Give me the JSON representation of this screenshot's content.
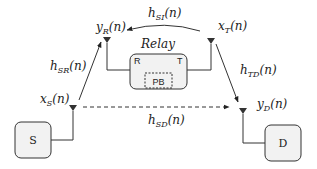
{
  "diagram": {
    "type": "full-duplex relay system model",
    "nodes": {
      "source": {
        "label": "S"
      },
      "destination": {
        "label": "D"
      },
      "relay": {
        "title": "Relay",
        "receive_port": "R",
        "transmit_port": "T",
        "buffer": "PB"
      }
    },
    "signals": {
      "x_S": {
        "base": "x",
        "sub": "S",
        "arg": "(n)"
      },
      "y_R": {
        "base": "y",
        "sub": "R",
        "arg": "(n)"
      },
      "x_T": {
        "base": "x",
        "sub": "T",
        "arg": "(n)"
      },
      "y_D": {
        "base": "y",
        "sub": "D",
        "arg": "(n)"
      }
    },
    "channels": {
      "h_SR": {
        "base": "h",
        "sub": "SR",
        "arg": "(n)",
        "style": "solid"
      },
      "h_SI": {
        "base": "h",
        "sub": "SI",
        "arg": "(n)",
        "style": "solid-curved"
      },
      "h_TD": {
        "base": "h",
        "sub": "TD",
        "arg": "(n)",
        "style": "solid"
      },
      "h_SD": {
        "base": "h",
        "sub": "SD",
        "arg": "(n)",
        "style": "dashed"
      }
    },
    "colors": {
      "stroke": "#222222",
      "box_fill": "#f2f2f2",
      "antenna": "#333333"
    }
  }
}
